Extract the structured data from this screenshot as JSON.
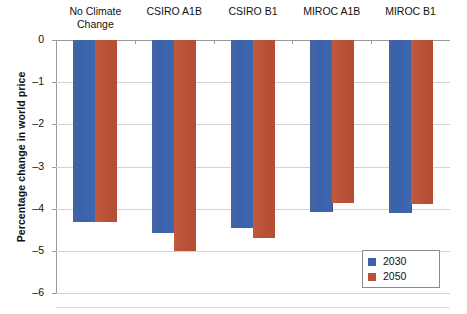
{
  "chart_data": {
    "type": "bar",
    "title": "",
    "subtitle": "",
    "xlabel": "",
    "ylabel": "Percentage change in world price",
    "categories": [
      "No Climate Change",
      "CSIRO A1B",
      "CSIRO B1",
      "MIROC A1B",
      "MIROC B1"
    ],
    "series": [
      {
        "name": "2030",
        "color": "#3a62ab",
        "values": [
          -4.31,
          -4.57,
          -4.45,
          -4.08,
          -4.1
        ]
      },
      {
        "name": "2050",
        "color": "#bc5238",
        "values": [
          -4.32,
          -5.0,
          -4.69,
          -3.86,
          -3.89
        ]
      }
    ],
    "ylim": [
      -6,
      0
    ],
    "yticks": [
      0,
      -1,
      -2,
      -3,
      -4,
      -5,
      -6
    ],
    "ytick_labels": [
      "0",
      "–1",
      "–2",
      "–3",
      "–4",
      "–5",
      "–6"
    ],
    "grid": true,
    "grid_axis": "y",
    "legend_position": "bottom-right",
    "legend_entries": [
      "2030",
      "2050"
    ],
    "x_axis_position": "top",
    "annotations": []
  },
  "legend": {
    "items": [
      {
        "label": "2030",
        "color": "#3a62ab",
        "swatch_name": "legend-swatch-2030"
      },
      {
        "label": "2050",
        "color": "#bc5238",
        "swatch_name": "legend-swatch-2050"
      }
    ]
  }
}
